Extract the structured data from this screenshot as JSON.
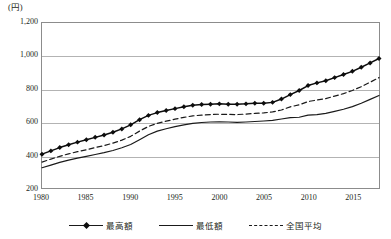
{
  "chart_data": {
    "type": "line",
    "title": "",
    "unit_label": "(円)",
    "xlabel": "",
    "ylabel": "",
    "xlim": [
      1980,
      2018
    ],
    "ylim": [
      200,
      1200
    ],
    "ytick_labels": [
      "1,200",
      "1,000",
      "800",
      "600",
      "400",
      "200"
    ],
    "ytick_values": [
      1200,
      1000,
      800,
      600,
      400,
      200
    ],
    "xtick_labels": [
      "1980",
      "1985",
      "1990",
      "1995",
      "2000",
      "2005",
      "2010",
      "2015"
    ],
    "xtick_values": [
      1980,
      1985,
      1990,
      1995,
      2000,
      2005,
      2010,
      2015
    ],
    "grid": "horizontal",
    "legend_position": "bottom",
    "x": [
      1980,
      1981,
      1982,
      1983,
      1984,
      1985,
      1986,
      1987,
      1988,
      1989,
      1990,
      1991,
      1992,
      1993,
      1994,
      1995,
      1996,
      1997,
      1998,
      1999,
      2000,
      2001,
      2002,
      2003,
      2004,
      2005,
      2006,
      2007,
      2008,
      2009,
      2010,
      2011,
      2012,
      2013,
      2014,
      2015,
      2016,
      2017,
      2018
    ],
    "series": [
      {
        "name": "最高額",
        "style": "solid-marker",
        "marker": "diamond",
        "color": "#0d0d0d",
        "values": [
          405,
          425,
          445,
          462,
          478,
          492,
          507,
          521,
          538,
          558,
          583,
          614,
          640,
          657,
          670,
          681,
          692,
          702,
          706,
          708,
          710,
          708,
          708,
          710,
          714,
          714,
          719,
          739,
          766,
          791,
          821,
          837,
          850,
          869,
          888,
          907,
          932,
          958,
          985
        ]
      },
      {
        "name": "最低額",
        "style": "solid",
        "marker": "none",
        "color": "#1a1a1a",
        "values": [
          323,
          339,
          355,
          369,
          381,
          392,
          403,
          414,
          427,
          444,
          464,
          493,
          523,
          545,
          559,
          572,
          583,
          592,
          597,
          600,
          601,
          600,
          598,
          600,
          603,
          606,
          610,
          618,
          627,
          629,
          642,
          645,
          652,
          664,
          677,
          693,
          714,
          737,
          761
        ]
      },
      {
        "name": "全国平均",
        "style": "dashed",
        "marker": "none",
        "color": "#1a1a1a",
        "values": [
          357,
          375,
          392,
          407,
          420,
          432,
          445,
          457,
          472,
          490,
          513,
          545,
          573,
          592,
          605,
          617,
          628,
          637,
          642,
          645,
          647,
          646,
          645,
          648,
          652,
          655,
          661,
          673,
          692,
          704,
          724,
          733,
          742,
          757,
          772,
          791,
          814,
          841,
          869
        ]
      }
    ]
  },
  "legend": {
    "items": [
      {
        "label": "最高額"
      },
      {
        "label": "最低額"
      },
      {
        "label": "全国平均"
      }
    ]
  }
}
